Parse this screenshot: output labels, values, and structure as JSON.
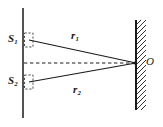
{
  "figure": {
    "type": "optics-ray-diagram",
    "width": 163,
    "height": 127,
    "background_color": "#ffffff",
    "stroke_color": "#1a1a1a"
  },
  "labels": {
    "slit_1": "S",
    "slit_1_sub": "1",
    "slit_2": "S",
    "slit_2_sub": "2",
    "ray_1": "r",
    "ray_1_sub": "1",
    "ray_2": "r",
    "ray_2_sub": "2",
    "point_o": "O"
  },
  "elements": {
    "barrier_label": "slit-barrier-line",
    "screen_label": "hatched-screen-wall",
    "axis_label": "central-dashed-axis",
    "slit_box_1_label": "dashed-slit-box-upper",
    "slit_box_2_label": "dashed-slit-box-lower"
  },
  "geometry": {
    "barrier_x": 23,
    "barrier_y_top": 8,
    "barrier_y_bottom": 118,
    "screen_x": 136,
    "screen_y_top": 20,
    "screen_y_bottom": 110,
    "hatch_width": 9,
    "slit_1_y": 40,
    "slit_2_y": 82,
    "point_o_x": 136,
    "point_o_y": 63,
    "slit_box_x": 24,
    "slit_box_width": 9,
    "slit_box_1_y": 33,
    "slit_box_2_y": 75,
    "slit_box_height": 14
  }
}
